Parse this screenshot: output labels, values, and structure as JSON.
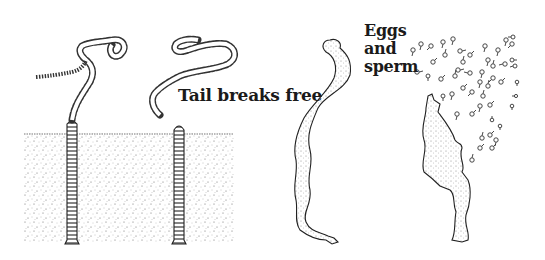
{
  "figure": {
    "labels": {
      "tail_breaks_free": "Tail breaks free",
      "eggs_and_sperm": [
        "Eggs",
        "and",
        "sperm"
      ]
    },
    "panels": [
      {
        "id": "worm-emerging",
        "description": "Worm in burrow with beaded tail extending above sediment"
      },
      {
        "id": "tail-detached",
        "description": "Worm in burrow with detached beaded tail floating free"
      },
      {
        "id": "tail-swimming",
        "description": "Free-swimming tail segment"
      },
      {
        "id": "tail-spawning",
        "description": "Tail segment bursting and releasing eggs and sperm"
      }
    ],
    "colors": {
      "ink": "#1a1a1a",
      "sediment_stipple": "#555555",
      "background": "#ffffff"
    }
  }
}
